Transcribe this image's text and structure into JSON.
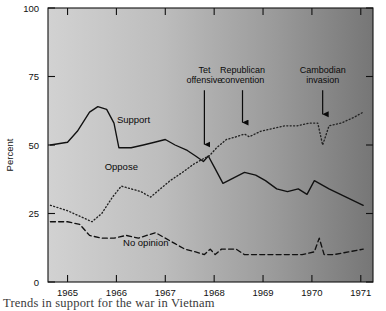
{
  "chart_data": {
    "type": "line",
    "title": "",
    "xlabel": "",
    "ylabel": "Percent",
    "xlim": [
      1964.6,
      1971.25
    ],
    "ylim": [
      0,
      100
    ],
    "grid": false,
    "legend_position": "inline-labels",
    "xticks": [
      1965,
      1966,
      1967,
      1968,
      1969,
      1970,
      1971
    ],
    "xticklabels": [
      "1965",
      "1966",
      "1967",
      "1968",
      "1969",
      "1970",
      "1971"
    ],
    "yticks": [
      0,
      25,
      50,
      75,
      100
    ],
    "yticklabels": [
      "0",
      "25",
      "50",
      "75",
      "100"
    ],
    "series": [
      {
        "name": "Support",
        "style": "solid",
        "color": "#111111",
        "x": [
          1964.65,
          1965.0,
          1965.2,
          1965.45,
          1965.62,
          1965.8,
          1965.95,
          1966.05,
          1966.3,
          1966.55,
          1966.78,
          1967.0,
          1967.2,
          1967.45,
          1967.62,
          1967.78,
          1967.88,
          1968.0,
          1968.18,
          1968.4,
          1968.62,
          1968.85,
          1969.05,
          1969.28,
          1969.5,
          1969.72,
          1969.9,
          1970.05,
          1970.35,
          1970.7,
          1971.05
        ],
        "y": [
          50,
          51,
          55,
          62,
          64,
          63,
          58,
          49,
          49,
          50,
          51,
          52,
          50,
          48,
          46,
          44,
          46,
          42,
          36,
          38,
          40,
          39,
          37,
          34,
          33,
          34,
          32,
          37,
          34,
          31,
          28
        ]
      },
      {
        "name": "Oppose",
        "style": "dotted",
        "color": "#222222",
        "x": [
          1964.65,
          1965.0,
          1965.25,
          1965.5,
          1965.7,
          1965.92,
          1966.1,
          1966.3,
          1966.5,
          1966.7,
          1966.9,
          1967.1,
          1967.35,
          1967.58,
          1967.78,
          1967.9,
          1968.05,
          1968.25,
          1968.45,
          1968.62,
          1968.72,
          1968.95,
          1969.2,
          1969.45,
          1969.7,
          1969.95,
          1970.12,
          1970.22,
          1970.35,
          1970.6,
          1970.85,
          1971.05
        ],
        "y": [
          28,
          26,
          24,
          22,
          25,
          31,
          35,
          34,
          33,
          31,
          34,
          37,
          40,
          43,
          45,
          46,
          49,
          52,
          53,
          54,
          53,
          55,
          56,
          57,
          57,
          58,
          58,
          50,
          57,
          58,
          60,
          62
        ]
      },
      {
        "name": "No opinion",
        "style": "dashed",
        "color": "#111111",
        "x": [
          1964.65,
          1965.0,
          1965.25,
          1965.45,
          1965.7,
          1965.95,
          1966.2,
          1966.45,
          1966.62,
          1966.8,
          1967.0,
          1967.2,
          1967.4,
          1967.62,
          1967.8,
          1967.92,
          1968.02,
          1968.15,
          1968.3,
          1968.45,
          1968.62,
          1969.0,
          1969.4,
          1969.8,
          1970.05,
          1970.15,
          1970.25,
          1970.45,
          1970.75,
          1971.05
        ],
        "y": [
          22,
          22,
          21,
          17,
          16,
          16,
          17,
          16,
          17,
          18,
          16,
          14,
          12,
          11,
          10,
          12,
          10,
          12,
          12,
          12,
          10,
          10,
          10,
          10,
          11,
          16,
          10,
          10,
          11,
          12
        ]
      }
    ],
    "series_labels": [
      {
        "name": "Support",
        "x": 1966.35,
        "y": 58
      },
      {
        "name": "Oppose",
        "x": 1966.1,
        "y": 41
      },
      {
        "name": "No opinion",
        "x": 1966.6,
        "y": 13
      }
    ],
    "annotations": [
      {
        "label_line1": "Tet",
        "label_line2": "offensive",
        "x": 1967.8,
        "arrow_top_y": 70,
        "arrow_bottom_y": 48
      },
      {
        "label_line1": "Republican",
        "label_line2": "convention",
        "x": 1968.58,
        "arrow_top_y": 70,
        "arrow_bottom_y": 56
      },
      {
        "label_line1": "Cambodian",
        "label_line2": "invasion",
        "x": 1970.22,
        "arrow_top_y": 70,
        "arrow_bottom_y": 59
      }
    ]
  },
  "caption": {
    "text": "Trends in support for the war in Vietnam"
  },
  "colors": {
    "plot_gradient_start": "#cfcfcf",
    "plot_gradient_end": "#787878",
    "axis": "#111111",
    "text": "#111111",
    "page_background": "#ffffff"
  }
}
